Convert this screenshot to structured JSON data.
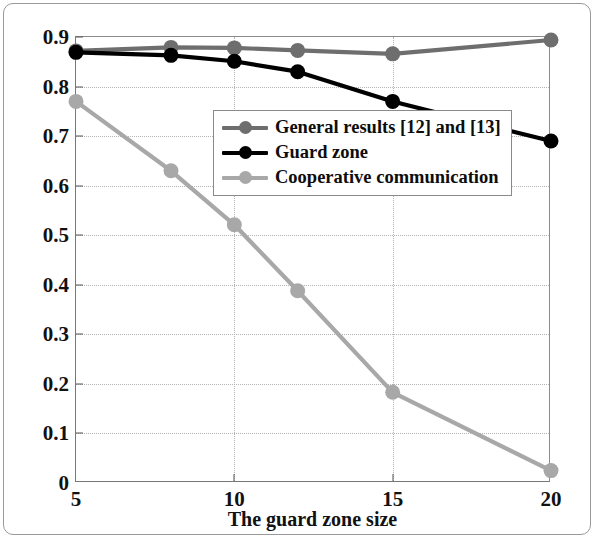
{
  "chart_data": {
    "type": "line",
    "title": "",
    "xlabel": "The guard zone size",
    "ylabel": "Two-way outage probability",
    "x": [
      5,
      8,
      10,
      12,
      15,
      20
    ],
    "xlim": [
      5,
      20
    ],
    "ylim": [
      0,
      0.9
    ],
    "xticks": [
      "5",
      "10",
      "15",
      "20"
    ],
    "xtick_values": [
      5,
      10,
      15,
      20
    ],
    "yticks": [
      "0",
      "0.1",
      "0.2",
      "0.3",
      "0.4",
      "0.5",
      "0.6",
      "0.7",
      "0.8",
      "0.9"
    ],
    "ytick_values": [
      0,
      0.1,
      0.2,
      0.3,
      0.4,
      0.5,
      0.6,
      0.7,
      0.8,
      0.9
    ],
    "grid": true,
    "legend_position": "center-right",
    "series": [
      {
        "name": "General results [12] and [13]",
        "color": "#6e6e6e",
        "marker": "circle",
        "values": [
          0.872,
          0.879,
          0.878,
          0.873,
          0.866,
          0.894
        ]
      },
      {
        "name": "Guard zone",
        "color": "#000000",
        "marker": "circle",
        "values": [
          0.869,
          0.863,
          0.851,
          0.83,
          0.77,
          0.69
        ]
      },
      {
        "name": "Cooperative communication",
        "color": "#a8a8a8",
        "marker": "circle",
        "values": [
          0.77,
          0.63,
          0.521,
          0.388,
          0.183,
          0.025
        ]
      }
    ]
  },
  "legend": {
    "items": [
      {
        "label": "General results [12] and [13]"
      },
      {
        "label": "Guard zone"
      },
      {
        "label": "Cooperative communication"
      }
    ]
  },
  "axes": {
    "y_title": "Two-way outage probability",
    "x_title": "The guard zone size"
  }
}
